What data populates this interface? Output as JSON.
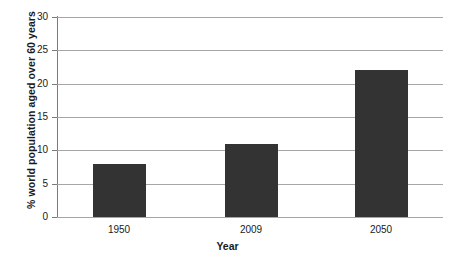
{
  "chart_data": {
    "type": "bar",
    "title": "",
    "subtitle": "",
    "xlabel": "Year",
    "ylabel": "% world population aged over 60 years",
    "categories": [
      "1950",
      "2009",
      "2050"
    ],
    "values": [
      8,
      11,
      22
    ],
    "series": [
      {
        "name": "% world population aged over 60 years",
        "values": [
          8,
          11,
          22
        ]
      }
    ],
    "ylim": [
      0,
      30
    ],
    "yticks": [
      0,
      5,
      10,
      15,
      20,
      25,
      30
    ],
    "ytick_labels": [
      "0",
      "5",
      "10",
      "15",
      "20",
      "25",
      "30"
    ],
    "grid": true,
    "grid_axis": "y",
    "legend": false,
    "legend_position": "none",
    "annotations": [],
    "colors": {
      "bar_fill": "#333333",
      "gridline": "#a6a6a6",
      "axis": "#7a7a7a",
      "text": "#1a1a1a",
      "background": "#ffffff"
    }
  }
}
